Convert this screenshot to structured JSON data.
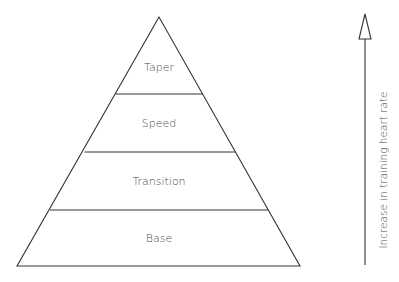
{
  "diagram": {
    "type": "pyramid",
    "levels": [
      {
        "label": "Taper"
      },
      {
        "label": "Speed"
      },
      {
        "label": "Transition"
      },
      {
        "label": "Base"
      }
    ],
    "arrow": {
      "direction": "up",
      "label": "Increase in training heart rate"
    },
    "colors": {
      "stroke": "#333333",
      "text": "#4a4a4a",
      "background": "#ffffff"
    }
  }
}
